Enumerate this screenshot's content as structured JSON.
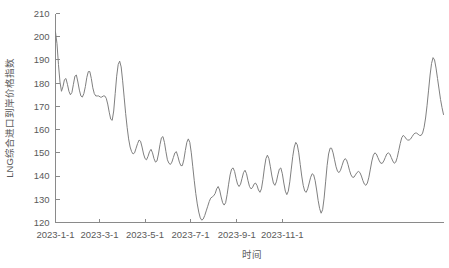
{
  "chart_data": {
    "type": "line",
    "title": "",
    "xlabel": "时间",
    "ylabel": "LNG综合进口到岸价格指数",
    "ylim": [
      120,
      210
    ],
    "yticks": [
      120,
      130,
      140,
      150,
      160,
      170,
      180,
      190,
      200,
      210
    ],
    "ytick_labels": [
      "120",
      "130",
      "140",
      "150",
      "160",
      "170",
      "180",
      "190",
      "200",
      "210"
    ],
    "xlim": [
      "2023-1-1",
      "2023-12-20"
    ],
    "xticks": [
      "2023-1-1",
      "2023-3-1",
      "2023-5-1",
      "2023-7-1",
      "2023-9-1",
      "2023-11-1"
    ],
    "xtick_labels": [
      "2023-1-1",
      "2023-3-1",
      "2023-5-1",
      "2023-7-1",
      "2023-9-1",
      "2023-11-1"
    ],
    "grid": false,
    "legend": false,
    "line_color": "#808080",
    "axis_color": "#8a8a8a",
    "series": [
      {
        "name": "LNG综合进口到岸价格指数",
        "x": [
          0,
          2,
          4,
          6,
          9,
          12,
          15,
          18,
          21,
          24,
          27,
          30,
          33,
          36,
          39,
          42,
          45,
          48,
          51,
          54,
          57,
          60,
          63,
          66,
          69,
          72,
          75,
          78,
          81,
          84,
          87,
          90,
          93,
          96,
          99,
          102,
          105,
          108,
          111,
          114,
          117,
          120,
          123,
          126,
          129,
          132,
          135,
          138,
          141,
          144,
          147,
          150,
          153,
          156,
          159,
          162,
          165,
          168,
          171,
          174,
          177,
          180,
          183,
          186,
          189,
          192,
          195,
          198,
          201,
          204,
          207,
          210,
          213,
          216,
          219,
          222,
          225,
          228,
          231,
          234,
          237,
          240,
          243,
          246,
          249,
          252,
          255,
          258,
          261,
          264,
          267,
          270,
          273,
          276,
          279,
          282,
          285,
          288,
          291,
          294,
          297,
          300,
          303,
          306,
          309,
          312,
          315,
          318,
          321,
          324,
          327,
          330,
          333,
          336,
          339,
          342,
          345,
          348,
          351,
          354
        ],
        "values": [
          202.0,
          197.5,
          189.0,
          182.0,
          177.0,
          180.0,
          182.5,
          180.5,
          177.0,
          175.0,
          176.5,
          180.5,
          184.0,
          183.0,
          179.0,
          175.5,
          174.0,
          174.5,
          176.5,
          180.5,
          184.5,
          185.5,
          183.5,
          179.0,
          175.0,
          174.5,
          174.5,
          174.0,
          173.8,
          174.0,
          174.5,
          174.0,
          172.0,
          168.0,
          164.0,
          166.5,
          174.0,
          182.0,
          188.0,
          189.5,
          186.0,
          179.0,
          172.0,
          166.0,
          161.0,
          156.0,
          152.5,
          150.5,
          149.5,
          150.0,
          152.0,
          154.0,
          155.5,
          155.0,
          153.0,
          150.5,
          148.0,
          147.0,
          148.0,
          150.5,
          151.5,
          150.0,
          147.5,
          146.0,
          146.5,
          149.0,
          153.0,
          156.5,
          157.5,
          155.0,
          151.0,
          147.5,
          145.5,
          145.0,
          145.5,
          147.0,
          149.5,
          150.5,
          149.0,
          146.5,
          144.5,
          144.0,
          145.5,
          149.0,
          153.5,
          156.0,
          155.0,
          151.0,
          145.0,
          139.0,
          133.5,
          129.0,
          125.5,
          123.0,
          121.5,
          121.0,
          122.0,
          124.0,
          126.5,
          128.5,
          130.0,
          131.0,
          131.5,
          132.0,
          133.0,
          135.0,
          135.5,
          134.0,
          131.5,
          129.0,
          127.5,
          127.5,
          129.5,
          133.5,
          138.0,
          142.0,
          144.5,
          145.0,
          143.5,
          141.0
        ],
        "x_full_note": "partial"
      }
    ],
    "data_points": [
      [
        0,
        202.0
      ],
      [
        2,
        197.0
      ],
      [
        4,
        188.0
      ],
      [
        6,
        180.5
      ],
      [
        8,
        176.5
      ],
      [
        10,
        178.5
      ],
      [
        12,
        181.5
      ],
      [
        14,
        182.0
      ],
      [
        16,
        179.5
      ],
      [
        18,
        176.5
      ],
      [
        20,
        175.0
      ],
      [
        22,
        176.0
      ],
      [
        24,
        179.5
      ],
      [
        26,
        183.0
      ],
      [
        28,
        183.5
      ],
      [
        30,
        180.5
      ],
      [
        32,
        177.0
      ],
      [
        34,
        174.5
      ],
      [
        36,
        174.0
      ],
      [
        38,
        175.5
      ],
      [
        40,
        178.5
      ],
      [
        42,
        182.5
      ],
      [
        44,
        185.0
      ],
      [
        46,
        185.0
      ],
      [
        48,
        182.0
      ],
      [
        50,
        178.0
      ],
      [
        52,
        175.5
      ],
      [
        54,
        174.5
      ],
      [
        56,
        174.5
      ],
      [
        58,
        174.5
      ],
      [
        60,
        174.0
      ],
      [
        62,
        174.0
      ],
      [
        64,
        174.5
      ],
      [
        66,
        174.5
      ],
      [
        68,
        173.5
      ],
      [
        70,
        171.0
      ],
      [
        72,
        167.5
      ],
      [
        74,
        164.5
      ],
      [
        76,
        164.0
      ],
      [
        78,
        168.0
      ],
      [
        80,
        175.5
      ],
      [
        82,
        183.0
      ],
      [
        84,
        188.0
      ],
      [
        86,
        189.5
      ],
      [
        88,
        187.0
      ],
      [
        90,
        181.0
      ],
      [
        92,
        174.0
      ],
      [
        94,
        167.0
      ],
      [
        96,
        161.0
      ],
      [
        98,
        156.0
      ],
      [
        100,
        152.5
      ],
      [
        102,
        150.5
      ],
      [
        104,
        149.5
      ],
      [
        106,
        150.0
      ],
      [
        108,
        152.0
      ],
      [
        110,
        154.0
      ],
      [
        112,
        155.5
      ],
      [
        114,
        155.0
      ],
      [
        116,
        152.5
      ],
      [
        118,
        149.5
      ],
      [
        120,
        147.5
      ],
      [
        122,
        147.0
      ],
      [
        124,
        148.5
      ],
      [
        126,
        150.5
      ],
      [
        128,
        151.5
      ],
      [
        130,
        150.0
      ],
      [
        132,
        147.5
      ],
      [
        134,
        146.0
      ],
      [
        136,
        146.5
      ],
      [
        138,
        149.5
      ],
      [
        140,
        153.5
      ],
      [
        142,
        156.5
      ],
      [
        144,
        157.0
      ],
      [
        146,
        154.5
      ],
      [
        148,
        150.5
      ],
      [
        150,
        147.0
      ],
      [
        152,
        145.5
      ],
      [
        154,
        145.0
      ],
      [
        156,
        146.0
      ],
      [
        158,
        148.0
      ],
      [
        160,
        150.0
      ],
      [
        162,
        150.5
      ],
      [
        164,
        148.5
      ],
      [
        166,
        146.0
      ],
      [
        168,
        144.5
      ],
      [
        170,
        144.5
      ],
      [
        172,
        147.0
      ],
      [
        174,
        151.0
      ],
      [
        176,
        154.5
      ],
      [
        178,
        156.0
      ],
      [
        180,
        154.5
      ],
      [
        182,
        150.0
      ],
      [
        184,
        144.0
      ],
      [
        186,
        138.0
      ],
      [
        188,
        132.5
      ],
      [
        190,
        128.0
      ],
      [
        192,
        124.5
      ],
      [
        194,
        122.0
      ],
      [
        196,
        121.0
      ],
      [
        198,
        121.5
      ],
      [
        200,
        123.0
      ],
      [
        202,
        125.0
      ],
      [
        204,
        127.0
      ],
      [
        206,
        129.0
      ],
      [
        208,
        130.5
      ],
      [
        210,
        131.0
      ],
      [
        212,
        131.5
      ],
      [
        214,
        132.5
      ],
      [
        216,
        134.5
      ],
      [
        218,
        135.5
      ],
      [
        220,
        134.0
      ],
      [
        222,
        131.0
      ],
      [
        224,
        128.5
      ],
      [
        226,
        127.5
      ],
      [
        228,
        128.5
      ],
      [
        230,
        132.0
      ],
      [
        232,
        136.5
      ],
      [
        234,
        140.5
      ],
      [
        236,
        143.0
      ],
      [
        238,
        143.5
      ],
      [
        240,
        142.0
      ],
      [
        242,
        139.0
      ],
      [
        244,
        136.5
      ],
      [
        246,
        135.5
      ],
      [
        248,
        136.5
      ],
      [
        250,
        139.0
      ],
      [
        252,
        141.5
      ],
      [
        254,
        142.5
      ],
      [
        256,
        141.0
      ],
      [
        258,
        138.0
      ],
      [
        260,
        135.5
      ],
      [
        262,
        134.5
      ],
      [
        264,
        135.0
      ],
      [
        266,
        136.5
      ],
      [
        268,
        137.0
      ],
      [
        270,
        136.0
      ],
      [
        272,
        134.0
      ],
      [
        274,
        133.0
      ],
      [
        276,
        134.5
      ],
      [
        278,
        138.5
      ],
      [
        280,
        143.5
      ],
      [
        282,
        147.5
      ],
      [
        284,
        149.0
      ],
      [
        286,
        147.5
      ],
      [
        288,
        144.0
      ],
      [
        290,
        140.0
      ],
      [
        292,
        137.0
      ],
      [
        294,
        136.0
      ],
      [
        296,
        137.5
      ],
      [
        298,
        140.5
      ],
      [
        300,
        143.0
      ],
      [
        302,
        143.5
      ],
      [
        304,
        141.0
      ],
      [
        306,
        137.0
      ],
      [
        308,
        133.5
      ],
      [
        310,
        132.0
      ],
      [
        312,
        133.5
      ],
      [
        314,
        137.5
      ],
      [
        316,
        143.0
      ],
      [
        318,
        148.5
      ],
      [
        320,
        152.5
      ],
      [
        322,
        154.5
      ],
      [
        324,
        153.5
      ],
      [
        326,
        150.0
      ],
      [
        328,
        145.0
      ],
      [
        330,
        140.0
      ],
      [
        332,
        136.0
      ],
      [
        334,
        133.5
      ],
      [
        336,
        133.0
      ],
      [
        338,
        134.5
      ],
      [
        340,
        137.0
      ],
      [
        342,
        139.5
      ],
      [
        344,
        141.0
      ],
      [
        346,
        140.5
      ],
      [
        348,
        138.0
      ],
      [
        350,
        134.0
      ],
      [
        352,
        129.5
      ],
      [
        354,
        126.0
      ],
      [
        356,
        124.0
      ],
      [
        358,
        125.5
      ],
      [
        360,
        130.5
      ],
      [
        362,
        137.5
      ],
      [
        364,
        144.5
      ],
      [
        366,
        149.5
      ],
      [
        368,
        152.0
      ],
      [
        370,
        152.0
      ],
      [
        372,
        150.0
      ],
      [
        374,
        147.0
      ],
      [
        376,
        144.0
      ],
      [
        378,
        142.0
      ],
      [
        380,
        141.5
      ],
      [
        382,
        142.5
      ],
      [
        384,
        144.5
      ],
      [
        386,
        146.5
      ],
      [
        388,
        147.5
      ],
      [
        390,
        147.0
      ],
      [
        392,
        145.0
      ],
      [
        394,
        142.5
      ],
      [
        396,
        140.5
      ],
      [
        398,
        139.5
      ],
      [
        400,
        139.5
      ],
      [
        402,
        140.5
      ],
      [
        404,
        141.5
      ],
      [
        406,
        142.0
      ],
      [
        408,
        141.5
      ],
      [
        410,
        140.0
      ],
      [
        412,
        138.0
      ],
      [
        414,
        136.5
      ],
      [
        416,
        136.0
      ],
      [
        418,
        137.0
      ],
      [
        420,
        139.5
      ],
      [
        422,
        143.0
      ],
      [
        424,
        146.5
      ],
      [
        426,
        149.0
      ],
      [
        428,
        150.0
      ],
      [
        430,
        149.5
      ],
      [
        432,
        148.0
      ],
      [
        434,
        146.5
      ],
      [
        436,
        145.5
      ],
      [
        438,
        145.5
      ],
      [
        440,
        146.5
      ],
      [
        442,
        148.0
      ],
      [
        444,
        149.5
      ],
      [
        446,
        150.0
      ],
      [
        448,
        149.5
      ],
      [
        450,
        148.0
      ],
      [
        452,
        146.5
      ],
      [
        454,
        145.5
      ],
      [
        456,
        146.0
      ],
      [
        458,
        148.0
      ],
      [
        460,
        151.0
      ],
      [
        462,
        154.0
      ],
      [
        464,
        156.5
      ],
      [
        466,
        157.5
      ],
      [
        468,
        157.0
      ],
      [
        470,
        156.0
      ],
      [
        472,
        155.5
      ],
      [
        474,
        155.5
      ],
      [
        476,
        156.0
      ],
      [
        478,
        157.0
      ],
      [
        480,
        158.0
      ],
      [
        482,
        158.5
      ],
      [
        484,
        158.5
      ],
      [
        486,
        158.0
      ],
      [
        488,
        157.5
      ],
      [
        490,
        157.5
      ],
      [
        492,
        158.5
      ],
      [
        494,
        161.0
      ],
      [
        496,
        165.0
      ],
      [
        498,
        170.5
      ],
      [
        500,
        177.0
      ],
      [
        502,
        183.5
      ],
      [
        504,
        188.5
      ],
      [
        506,
        191.0
      ],
      [
        508,
        190.0
      ],
      [
        510,
        186.5
      ],
      [
        512,
        182.0
      ],
      [
        514,
        177.5
      ],
      [
        516,
        173.0
      ],
      [
        518,
        169.5
      ],
      [
        520,
        166.5
      ]
    ],
    "x_range_units": [
      0,
      520
    ]
  },
  "axis": {
    "y_title": "LNG综合进口到岸价格指数",
    "x_title": "时间"
  }
}
